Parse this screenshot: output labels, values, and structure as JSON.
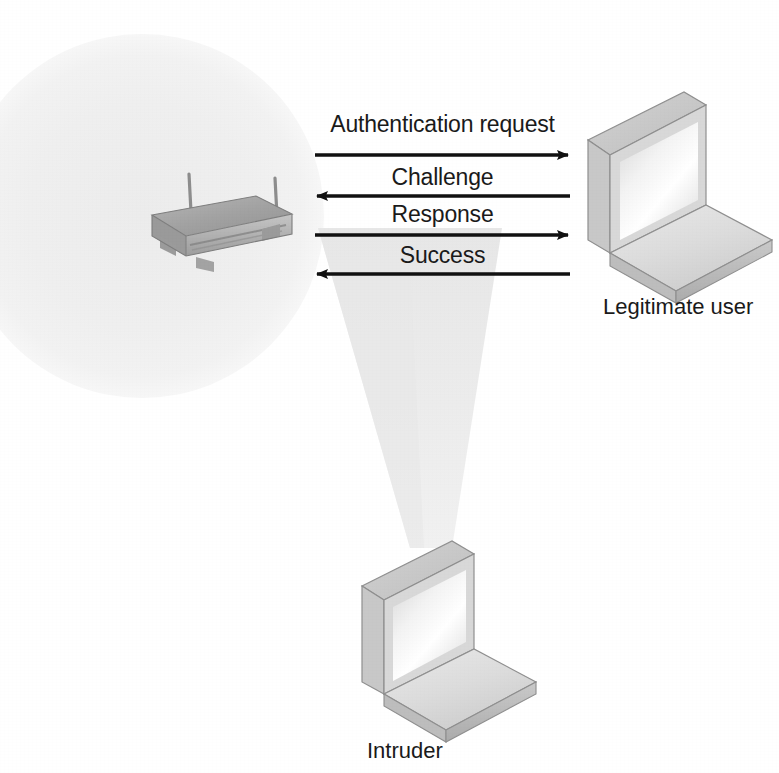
{
  "diagram": {
    "canvas": {
      "width": 779,
      "height": 773,
      "background": "#ffffff"
    },
    "colors": {
      "coverage_circle": "#f0f0f0",
      "signal_cone": "#ededed",
      "cone_overlap": "#e6e6e6",
      "arrow": "#111111",
      "text": "#1a1a1a",
      "device_light": "#e8e8e8",
      "device_mid": "#cfcfcf",
      "device_dark": "#a8a8a8",
      "device_outline": "#8f8f8f",
      "ap_top": "#a9a9a9",
      "ap_front": "#b9b9b9",
      "ap_side": "#8e8e8e"
    },
    "messages": [
      {
        "id": "authentication-request",
        "label": "Authentication request",
        "direction": "right",
        "arrow_y": 155,
        "label_y": 113
      },
      {
        "id": "challenge",
        "label": "Challenge",
        "direction": "left",
        "arrow_y": 196,
        "label_y": 166
      },
      {
        "id": "response",
        "label": "Response",
        "direction": "right",
        "arrow_y": 235,
        "label_y": 203
      },
      {
        "id": "success",
        "label": "Success",
        "direction": "left",
        "arrow_y": 274,
        "label_y": 244
      }
    ],
    "arrow_span": {
      "x_start": 315,
      "x_end": 570
    },
    "nodes": [
      {
        "id": "access-point",
        "label": "",
        "kind": "wireless-access-point",
        "x": 200,
        "y": 212
      },
      {
        "id": "legitimate-user",
        "label": "Legitimate user",
        "kind": "laptop",
        "label_x": 603,
        "label_y": 296
      },
      {
        "id": "intruder",
        "label": "Intruder",
        "kind": "laptop",
        "label_x": 367,
        "label_y": 740
      }
    ],
    "regions": [
      {
        "id": "coverage-area",
        "kind": "circle",
        "cx": 142,
        "cy": 216,
        "r": 182
      },
      {
        "id": "signal-cone",
        "kind": "cone",
        "apex_x": 432,
        "apex_y": 548
      }
    ]
  }
}
